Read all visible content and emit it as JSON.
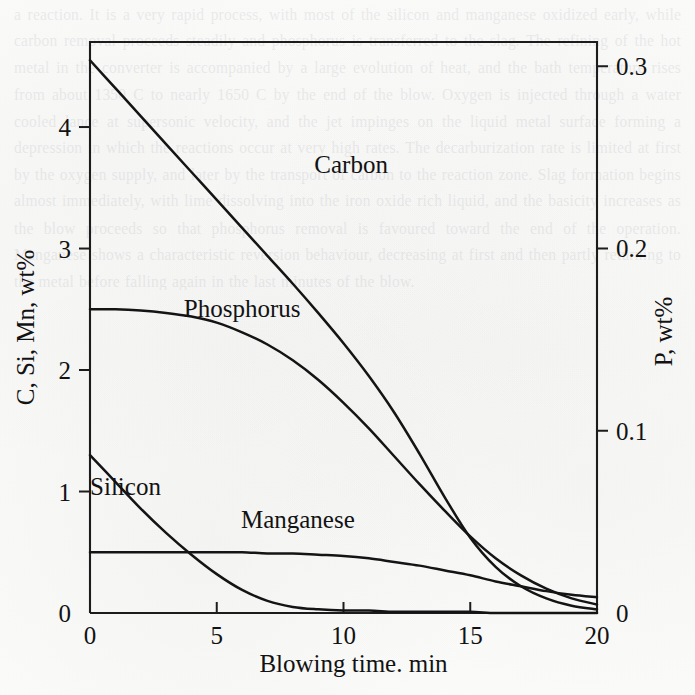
{
  "page": {
    "background_color": "#fbfbfa",
    "ink_color": "#141414",
    "ghost_text": "a reaction. It is a very rapid process, with most of the silicon and manganese oxidized early, while carbon removal proceeds steadily and phosphorus is transferred to the slag. The refining of the hot metal in the converter is accompanied by a large evolution of heat, and the bath temperature rises from about 1350 C to nearly 1650 C by the end of the blow. Oxygen is injected through a water cooled lance at supersonic velocity, and the jet impinges on the liquid metal surface forming a depression in which the reactions occur at very high rates. The decarburization rate is limited at first by the oxygen supply, and later by the transport of carbon to the reaction zone. Slag formation begins almost immediately, with lime dissolving into the iron oxide rich liquid, and the basicity increases as the blow proceeds so that phosphorus removal is favoured toward the end of the operation. Manganese shows a characteristic reversion behaviour, decreasing at first and then partly returning to the metal before falling again in the last minutes of the blow."
  },
  "chart_data": {
    "type": "line",
    "title": "",
    "xlabel": "Blowing time. min",
    "ylabel": "C, Si, Mn, wt%",
    "ylabel_right": "P, wt%",
    "xlim": [
      0,
      20
    ],
    "ylim": [
      0,
      4.7
    ],
    "ylim_right": [
      0,
      0.3133
    ],
    "xticks": [
      0,
      5,
      10,
      15,
      20
    ],
    "xtick_labels": [
      "0",
      "5",
      "10",
      "15",
      "20"
    ],
    "yticks": [
      0,
      1,
      2,
      3,
      4
    ],
    "ytick_labels": [
      "0",
      "1",
      "2",
      "3",
      "4"
    ],
    "yticks_right": [
      0,
      0.1,
      0.2,
      0.3
    ],
    "ytick_labels_right": [
      "0",
      "0.1",
      "0.2",
      "0.3"
    ],
    "grid": false,
    "legend": "inline-labels",
    "x": [
      0,
      1,
      2,
      3,
      4,
      5,
      6,
      7,
      8,
      9,
      10,
      11,
      12,
      13,
      14,
      15,
      16,
      17,
      18,
      19,
      20
    ],
    "series": [
      {
        "name": "Carbon",
        "label": "Carbon",
        "axis": "left",
        "units": "wt%",
        "label_x": 10.3,
        "label_y": 3.62,
        "values": [
          4.55,
          4.32,
          4.09,
          3.86,
          3.63,
          3.4,
          3.17,
          2.94,
          2.71,
          2.47,
          2.22,
          1.95,
          1.65,
          1.31,
          0.95,
          0.62,
          0.38,
          0.22,
          0.12,
          0.06,
          0.03
        ]
      },
      {
        "name": "Phosphorus",
        "label": "Phosphorus",
        "axis": "right",
        "units": "wt%",
        "label_x": 6.0,
        "label_y": 2.44,
        "values_left_scale": [
          2.5,
          2.5,
          2.49,
          2.47,
          2.44,
          2.39,
          2.31,
          2.21,
          2.08,
          1.92,
          1.73,
          1.52,
          1.29,
          1.06,
          0.84,
          0.63,
          0.45,
          0.31,
          0.2,
          0.12,
          0.07
        ],
        "values": [
          0.166,
          0.166,
          0.166,
          0.164,
          0.163,
          0.159,
          0.154,
          0.147,
          0.139,
          0.128,
          0.115,
          0.101,
          0.086,
          0.071,
          0.056,
          0.042,
          0.03,
          0.021,
          0.013,
          0.008,
          0.005
        ]
      },
      {
        "name": "Silicon",
        "label": "Silicon",
        "axis": "left",
        "units": "wt%",
        "label_x": 1.4,
        "label_y": 0.97,
        "values": [
          1.3,
          1.08,
          0.86,
          0.66,
          0.48,
          0.32,
          0.19,
          0.1,
          0.05,
          0.03,
          0.02,
          0.02,
          0.01,
          0.01,
          0.01,
          0.01,
          0.0,
          0.0,
          0.0,
          0.0,
          0.0
        ]
      },
      {
        "name": "Manganese",
        "label": "Manganese",
        "axis": "left",
        "units": "wt%",
        "label_x": 8.2,
        "label_y": 0.7,
        "values": [
          0.5,
          0.5,
          0.5,
          0.5,
          0.5,
          0.5,
          0.5,
          0.49,
          0.49,
          0.48,
          0.47,
          0.45,
          0.42,
          0.39,
          0.35,
          0.31,
          0.26,
          0.22,
          0.18,
          0.15,
          0.13
        ]
      }
    ]
  }
}
